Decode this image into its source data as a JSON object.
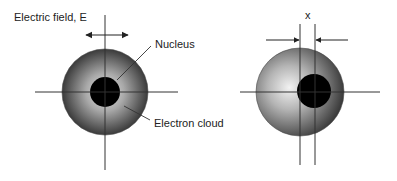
{
  "diagram": {
    "labels": {
      "field": "Electric field, E",
      "nucleus": "Nucleus",
      "cloud": "Electron cloud",
      "displacement": "x"
    },
    "atoms": [
      {
        "name": "unpolarized-atom",
        "cloud_center": [
          105,
          92
        ],
        "cloud_radius": 43,
        "nucleus_center": [
          105,
          92
        ],
        "nucleus_radius": 15
      },
      {
        "name": "polarized-atom",
        "cloud_center": [
          300,
          92
        ],
        "cloud_radius": 44,
        "nucleus_center": [
          314,
          91
        ],
        "nucleus_radius": 17
      }
    ],
    "colors": {
      "line": "#333333",
      "nucleus": "#000000",
      "cloud_light": "#d8d8d8",
      "cloud_dark": "#3a3a3a",
      "text": "#222222"
    }
  }
}
